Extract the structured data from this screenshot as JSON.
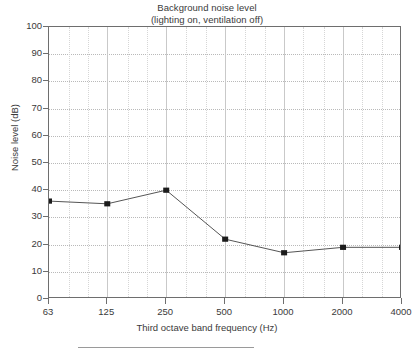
{
  "chart_data": {
    "type": "line",
    "title": "Background noise level",
    "subtitle": "(lighting on, ventilation off)",
    "xlabel": "Third octave band frequency (Hz)",
    "ylabel": "Noise level (dB)",
    "xscale": "log",
    "x_tick_labels": [
      "63",
      "125",
      "250",
      "500",
      "1000",
      "2000",
      "4000"
    ],
    "x": [
      63,
      125,
      250,
      500,
      1000,
      2000,
      4000
    ],
    "values": [
      36,
      35,
      40,
      22,
      17,
      19,
      19
    ],
    "y_tick_labels": [
      "0",
      "10",
      "20",
      "30",
      "40",
      "50",
      "60",
      "70",
      "80",
      "90",
      "100"
    ],
    "ylim": [
      0,
      100
    ],
    "ytick_step": 10,
    "grid": "major-and-minor",
    "legend": "none",
    "marker": "filled-square",
    "series": [
      {
        "name": "Background noise level",
        "points": [
          {
            "freq": "63",
            "level": 36
          },
          {
            "freq": "125",
            "level": 35
          },
          {
            "freq": "250",
            "level": 40
          },
          {
            "freq": "500",
            "level": 22
          },
          {
            "freq": "1000",
            "level": 17
          },
          {
            "freq": "2000",
            "level": 19
          },
          {
            "freq": "4000",
            "level": 19
          }
        ]
      }
    ],
    "colors": {
      "line": "#555555",
      "marker": "#1b1b1b",
      "frame": "#6e6e6e",
      "grid_major": "#c9c9c9",
      "grid_minor": "#d6d6d6",
      "text": "#3a3a3a",
      "background": "#ffffff"
    }
  }
}
